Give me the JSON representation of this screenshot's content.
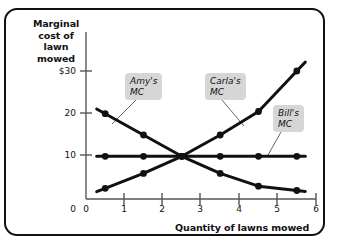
{
  "chart_data": {
    "type": "line",
    "title": "",
    "xlabel": "Quantity of lawns mowed",
    "ylabel": "Marginal cost of lawn mowed",
    "xlim": [
      0,
      6
    ],
    "ylim": [
      0,
      34
    ],
    "xticks": [
      "0",
      "1",
      "2",
      "3",
      "4",
      "5",
      "6"
    ],
    "yticks": [
      "0",
      "10",
      "20",
      "$30"
    ],
    "grid": false,
    "legend_position": "inline-callouts",
    "annotations": [
      "Amy's\nMC",
      "Carla's\nMC",
      "Bill's\nMC"
    ],
    "series": [
      {
        "name": "Amy's MC",
        "label": "Amy's\nMC",
        "x": [
          0.5,
          1.5,
          2.5,
          3.5,
          4.5,
          5.5
        ],
        "values": [
          20,
          15,
          10,
          6,
          3,
          2
        ]
      },
      {
        "name": "Bill's MC",
        "label": "Bill's\nMC",
        "x": [
          0.5,
          1.5,
          2.5,
          3.5,
          4.5,
          5.5
        ],
        "values": [
          10,
          10,
          10,
          10,
          10,
          10
        ]
      },
      {
        "name": "Carla's MC",
        "label": "Carla's\nMC",
        "x": [
          0.5,
          1.5,
          2.5,
          3.5,
          4.5,
          5.5
        ],
        "values": [
          2.5,
          6,
          10,
          15,
          20.5,
          30
        ]
      }
    ]
  },
  "axes": {
    "y_title": "Marginal\ncost of\nlawn mowed",
    "x_title": "Quantity of lawns mowed"
  },
  "callouts": [
    {
      "name": "amy",
      "text": "Amy's\nMC"
    },
    {
      "name": "carla",
      "text": "Carla's\nMC"
    },
    {
      "name": "bill",
      "text": "Bill's\nMC"
    }
  ],
  "colors": {
    "line": "#111111",
    "callout_bg": "#d6d6d6",
    "frame": "#111111",
    "axis": "#555555",
    "background": "#ffffff"
  }
}
